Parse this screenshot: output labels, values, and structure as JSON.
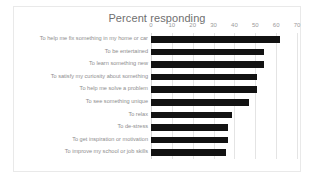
{
  "chart_data": {
    "type": "bar",
    "orientation": "horizontal",
    "title": "Percent responding",
    "xlabel": "",
    "ylabel": "",
    "xlim": [
      0,
      70
    ],
    "xticks": [
      0,
      10,
      20,
      30,
      40,
      50,
      60,
      70
    ],
    "grid": true,
    "legend": false,
    "bar_color": "#121212",
    "categories": [
      "To help me fix something in my home or car",
      "To be entertained",
      "To learn something new",
      "To satisfy my curiosity about something",
      "To help me solve a problem",
      "To see something unique",
      "To relax",
      "To de-stress",
      "To get inspiration or motivation",
      "To improve my school or job skills"
    ],
    "values": [
      62,
      54,
      54,
      51,
      51,
      47,
      39,
      37,
      37,
      36
    ]
  }
}
